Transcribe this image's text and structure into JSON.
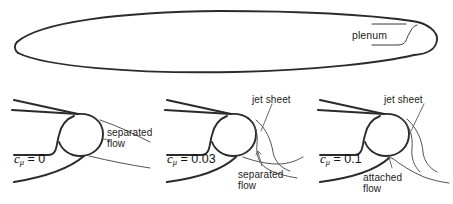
{
  "figure": {
    "kind": "airfoil-circulation-control-diagram",
    "width": 453,
    "height": 204,
    "background_color": "#ffffff",
    "line_color": "#2b2b2b",
    "flow_line_color": "#4a4a4a",
    "text_color": "#1c1c1c"
  },
  "top_panel": {
    "name": "full-airfoil",
    "shape": "slender elliptic airfoil with rounded trailing edge",
    "plenum_label": "plenum"
  },
  "panels": [
    {
      "id": "panel-cmu-0",
      "symbol": "c",
      "subscript": "μ",
      "equals": "=",
      "value": "0",
      "label_full": "cμ = 0",
      "annotations": [
        {
          "id": "separated-flow",
          "line1": "separated",
          "line2": "flow"
        }
      ],
      "jet_sheet_label": null
    },
    {
      "id": "panel-cmu-003",
      "symbol": "c",
      "subscript": "μ",
      "equals": "=",
      "value": "0.03",
      "label_full": "cμ = 0.03",
      "annotations": [
        {
          "id": "separated-flow",
          "line1": "separated",
          "line2": "flow"
        }
      ],
      "jet_sheet_label": "jet sheet"
    },
    {
      "id": "panel-cmu-01",
      "symbol": "c",
      "subscript": "μ",
      "equals": "=",
      "value": "0.1",
      "label_full": "cμ = 0.1",
      "annotations": [
        {
          "id": "attached-flow",
          "line1": "attached",
          "line2": "flow"
        }
      ],
      "jet_sheet_label": "jet sheet"
    }
  ]
}
